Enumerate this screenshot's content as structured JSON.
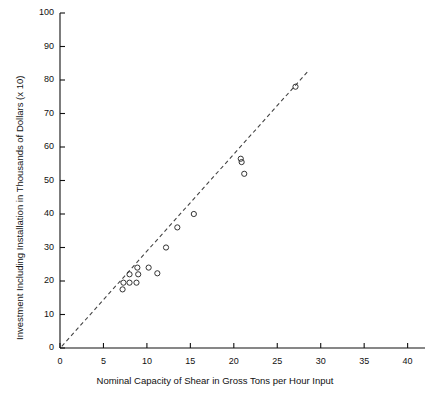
{
  "chart_data": {
    "type": "scatter",
    "title": "",
    "xlabel": "Nominal Capacity of Shear in Gross Tons per Hour Input",
    "ylabel": "Investment Including Installation in Thousands of Dollars (x 10)",
    "xlim": [
      0,
      42
    ],
    "ylim": [
      0,
      100
    ],
    "xticks": [
      0,
      5,
      10,
      15,
      20,
      25,
      30,
      35,
      40
    ],
    "yticks": [
      0,
      10,
      20,
      30,
      40,
      50,
      60,
      70,
      80,
      90,
      100
    ],
    "xtick_labels": [
      "0",
      "5",
      "10",
      "15",
      "20",
      "25",
      "30",
      "35",
      "40"
    ],
    "ytick_labels": [
      "0",
      "10",
      "20",
      "30",
      "40",
      "50",
      "60",
      "70",
      "80",
      "90",
      "100"
    ],
    "grid": false,
    "legend": null,
    "marker": "open-circle",
    "marker_color": "#333333",
    "series": [
      {
        "name": "Shear investment observations",
        "points": [
          {
            "x": 7.2,
            "y": 17.5
          },
          {
            "x": 7.3,
            "y": 19.5
          },
          {
            "x": 8.0,
            "y": 19.5
          },
          {
            "x": 8.8,
            "y": 19.5
          },
          {
            "x": 8.0,
            "y": 22.0
          },
          {
            "x": 9.0,
            "y": 22.0
          },
          {
            "x": 8.9,
            "y": 24.0
          },
          {
            "x": 10.2,
            "y": 24.0
          },
          {
            "x": 11.2,
            "y": 22.3
          },
          {
            "x": 12.2,
            "y": 30.0
          },
          {
            "x": 13.5,
            "y": 36.0
          },
          {
            "x": 15.4,
            "y": 40.0
          },
          {
            "x": 20.8,
            "y": 56.5
          },
          {
            "x": 20.9,
            "y": 55.5
          },
          {
            "x": 21.2,
            "y": 52.0
          },
          {
            "x": 27.1,
            "y": 78.0
          }
        ]
      }
    ],
    "trendline": {
      "style": "dashed",
      "color": "#444444",
      "x_start": 0.2,
      "y_start": 0.5,
      "x_end": 28.5,
      "y_end": 82.5
    }
  },
  "axes": {
    "x_axis_name": "x-axis",
    "y_axis_name": "y-axis"
  }
}
